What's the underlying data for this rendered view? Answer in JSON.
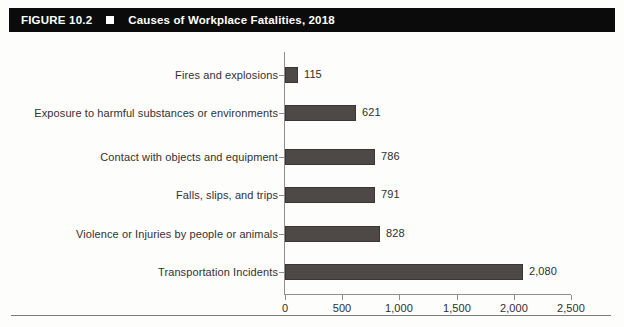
{
  "header": {
    "figure_number": "FIGURE 10.2",
    "bullet_icon": "square-bullet-icon",
    "title": "Causes of Workplace Fatalities, 2018",
    "background_color": "#0b0b0b",
    "text_color": "#ffffff"
  },
  "chart_data": {
    "type": "bar",
    "orientation": "horizontal",
    "title": "Causes of Workplace Fatalities, 2018",
    "xlabel": "",
    "ylabel": "",
    "xlim": [
      0,
      2500
    ],
    "grid": false,
    "legend": null,
    "bar_color": "#4e4846",
    "categories": [
      "Fires and explosions",
      "Exposure to harmful substances or environments",
      "Contact with objects and equipment",
      "Falls, slips, and trips",
      "Violence or Injuries by people or animals",
      "Transportation Incidents"
    ],
    "values": [
      115,
      621,
      786,
      791,
      828,
      2080
    ],
    "value_labels": [
      "115",
      "621",
      "786",
      "791",
      "828",
      "2,080"
    ],
    "xticks": [
      0,
      500,
      1000,
      1500,
      2000,
      2500
    ],
    "xtick_labels": [
      "0",
      "500",
      "1,000",
      "1,500",
      "2,000",
      "2,500"
    ]
  }
}
